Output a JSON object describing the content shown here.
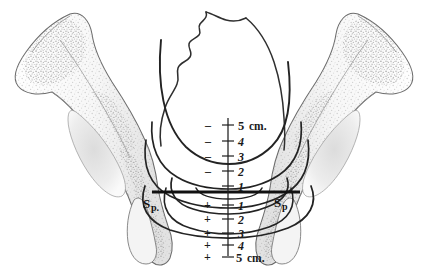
{
  "figure": {
    "background_color": "#ffffff",
    "ink_color": "#2b2b2b",
    "bone_outline_color": "#6f6f6f",
    "bone_fill_color": "#fbfbfb",
    "bone_shade_color": "#e3e3e3",
    "stipple_color": "#b9b9b9",
    "arc_color": "#262626",
    "axis_color": "#1f1f1f",
    "spine_line_color": "#111111"
  },
  "axis": {
    "name": "station-scale",
    "orientation": "vertical",
    "center_x": 228,
    "top_y": 118,
    "bottom_y": 252,
    "unit_label_top": "5 cm.",
    "unit_label_bottom": "5 cm.",
    "zero_reference": "interspinous line",
    "minus_sign": "–",
    "plus_sign": "+",
    "ticks": [
      {
        "label": "5 cm.",
        "value": "-5",
        "sign": "–",
        "number": "5",
        "unit": "cm.",
        "y": 125,
        "major": true
      },
      {
        "label": "4",
        "value": "-4",
        "sign": "–",
        "number": "4",
        "unit": "",
        "y": 141,
        "major": false
      },
      {
        "label": "3",
        "value": "-3",
        "sign": "–",
        "number": "3",
        "unit": "",
        "y": 156,
        "major": false
      },
      {
        "label": "2",
        "value": "-2",
        "sign": "–",
        "number": "2",
        "unit": "",
        "y": 171,
        "major": false
      },
      {
        "label": "1",
        "value": "-1",
        "sign": "–",
        "number": "1",
        "unit": "",
        "y": 186,
        "major": false
      },
      {
        "label": "1",
        "value": "+1",
        "sign": "+",
        "number": "1",
        "unit": "",
        "y": 205,
        "major": false
      },
      {
        "label": "2",
        "value": "+2",
        "sign": "+",
        "number": "2",
        "unit": "",
        "y": 219,
        "major": false
      },
      {
        "label": "3",
        "value": "+3",
        "sign": "+",
        "number": "3",
        "unit": "",
        "y": 233,
        "major": false
      },
      {
        "label": "4",
        "value": "+4",
        "sign": "+",
        "number": "4",
        "unit": "",
        "y": 245,
        "major": false
      },
      {
        "label": "5 cm.",
        "value": "+5",
        "sign": "+",
        "number": "5",
        "unit": "cm.",
        "y": 257,
        "major": true
      }
    ]
  },
  "spines": {
    "name": "interspinous-line",
    "y": 192,
    "x_left": 152,
    "x_right": 300,
    "left_label": "Sp.",
    "left_label_main": "S",
    "left_label_sub": "p.",
    "right_label": "Sp",
    "right_label_main": "S",
    "right_label_sub": "p"
  },
  "head": {
    "name": "fetal-head-outline",
    "description": "fetal cranium in outline with sutured vertex contour"
  },
  "stations": [
    {
      "name": "station-minus-3-arc",
      "lowest_point_label": "-3"
    },
    {
      "name": "station-minus-2-arc",
      "lowest_point_label": "-2"
    },
    {
      "name": "station-minus-1-arc",
      "lowest_point_label": "-1"
    },
    {
      "name": "station-zero-arc",
      "lowest_point_label": "0"
    },
    {
      "name": "station-plus-1-arc",
      "lowest_point_label": "+1"
    },
    {
      "name": "station-plus-2-arc",
      "lowest_point_label": "+2"
    },
    {
      "name": "station-plus-4-arc",
      "lowest_point_label": "+4"
    }
  ],
  "bones": {
    "left": {
      "name": "left-innominate-bone",
      "label": "left hip bone"
    },
    "right": {
      "name": "right-innominate-bone",
      "label": "right hip bone"
    }
  }
}
